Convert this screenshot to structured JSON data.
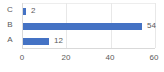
{
  "chart_data": {
    "type": "bar",
    "orientation": "horizontal",
    "title": "",
    "xlabel": "",
    "ylabel": "",
    "categories": [
      "C",
      "B",
      "A"
    ],
    "values": [
      2,
      54,
      12
    ],
    "data_labels": [
      "2",
      "54",
      "12"
    ],
    "xlim": [
      0,
      60
    ],
    "xticks": [
      0,
      20,
      40,
      60
    ],
    "xtick_labels": [
      "0",
      "20",
      "40",
      "60"
    ],
    "grid": true,
    "grid_axis": "x",
    "legend": false,
    "series": [
      {
        "name": "",
        "color": "#4472C4",
        "values": [
          2,
          54,
          12
        ]
      }
    ]
  },
  "style": {
    "bar_color": "#4472C4",
    "grid_color": "#E8E8E8",
    "axis_color": "#D9D9D9",
    "text_color": "#5A5A5A",
    "background": "#FFFFFF"
  }
}
